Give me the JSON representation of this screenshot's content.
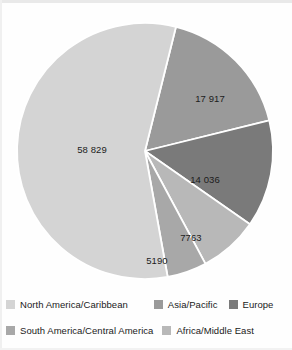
{
  "chart_data": {
    "type": "pie",
    "title": "",
    "subtitle": "",
    "xlabel": "",
    "ylabel": "",
    "legend_position": "bottom",
    "grid": false,
    "total": 103735,
    "categories": [
      "North America/Caribbean",
      "Asia/Pacific",
      "Europe",
      "Africa/Middle East",
      "South America/Central America"
    ],
    "values": [
      58829,
      17917,
      14036,
      7763,
      5190
    ],
    "labels": [
      "58 829",
      "17 917",
      "14 036",
      "7763",
      "5190"
    ],
    "colors": [
      "#d4d4d4",
      "#9a9a9a",
      "#7a7a7a",
      "#b8b8b8",
      "#a8a8a8"
    ],
    "slices": [
      {
        "name": "asia-pacific",
        "label": "Asia/Pacific",
        "value": 17917,
        "display": "17 917",
        "color": "#9a9a9a",
        "start_angle": 14,
        "end_angle": 76.2,
        "label_x": 210,
        "label_y": 99
      },
      {
        "name": "europe",
        "label": "Europe",
        "value": 14036,
        "display": "14 036",
        "color": "#7a7a7a",
        "start_angle": 76.2,
        "end_angle": 124.9,
        "label_x": 205,
        "label_y": 180
      },
      {
        "name": "africa-middle-east",
        "label": "Africa/Middle East",
        "value": 7763,
        "display": "7763",
        "color": "#b8b8b8",
        "start_angle": 124.9,
        "end_angle": 151.8,
        "label_x": 191,
        "label_y": 238
      },
      {
        "name": "south-america-central-america",
        "label": "South America/Central America",
        "value": 5190,
        "display": "5190",
        "color": "#a8a8a8",
        "start_angle": 151.8,
        "end_angle": 169.8,
        "label_x": 157,
        "label_y": 261
      },
      {
        "name": "north-america-caribbean",
        "label": "North America/Caribbean",
        "value": 58829,
        "display": "58 829",
        "color": "#d4d4d4",
        "start_angle": 169.8,
        "end_angle": 374,
        "label_x": 92,
        "label_y": 150
      }
    ],
    "geometry": {
      "center_x": 145,
      "center_y": 151,
      "radius": 128,
      "separator_color": "#ffffff",
      "separator_width": 1.8
    }
  },
  "legend": {
    "rows": [
      [
        {
          "label": "North America/Caribbean",
          "color": "#d4d4d4",
          "name": "north-america-caribbean"
        },
        {
          "label": "Asia/Pacific",
          "color": "#9a9a9a",
          "name": "asia-pacific"
        },
        {
          "label": "Europe",
          "color": "#7a7a7a",
          "name": "europe"
        }
      ],
      [
        {
          "label": "South America/Central America",
          "color": "#a8a8a8",
          "name": "south-america-central-america"
        },
        {
          "label": "Africa/Middle East",
          "color": "#b8b8b8",
          "name": "africa-middle-east"
        }
      ]
    ]
  }
}
